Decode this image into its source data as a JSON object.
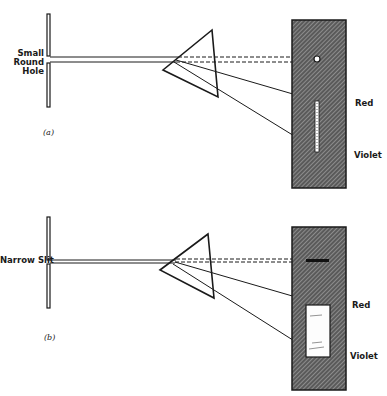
{
  "panels": [
    {
      "id": "a",
      "label": "(a)",
      "aperture_label_lines": [
        "Small",
        "Round",
        "Hole"
      ],
      "screen_top_label": "Red",
      "screen_bottom_label": "Violet",
      "image_type": "small round hole spectrum (narrow line)"
    },
    {
      "id": "b",
      "label": "(b)",
      "aperture_label": "Narrow Slit",
      "screen_top_label": "Red",
      "screen_bottom_label": "Violet",
      "image_type": "narrow slit spectrum (broad band)"
    }
  ],
  "colors": {
    "line": "#1a1a1a",
    "screen_fill": "#6e6e6e",
    "background": "#ffffff"
  }
}
